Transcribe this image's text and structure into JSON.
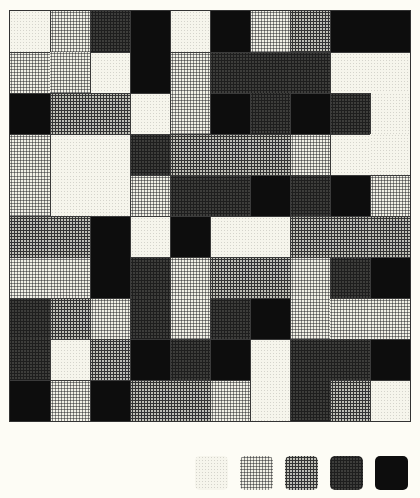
{
  "figure": {
    "rows": 10,
    "cols": 10,
    "levels": [
      1,
      2,
      3,
      4,
      5
    ],
    "grid": [
      [
        1,
        2,
        4,
        5,
        1,
        5,
        2,
        3,
        5,
        5
      ],
      [
        2,
        2,
        1,
        5,
        2,
        4,
        4,
        4,
        1,
        1
      ],
      [
        5,
        3,
        3,
        1,
        2,
        5,
        4,
        5,
        4,
        1
      ],
      [
        2,
        1,
        1,
        4,
        3,
        3,
        3,
        2,
        1,
        1
      ],
      [
        2,
        1,
        1,
        2,
        4,
        4,
        5,
        4,
        5,
        2
      ],
      [
        3,
        3,
        5,
        1,
        5,
        1,
        1,
        3,
        3,
        3
      ],
      [
        2,
        2,
        5,
        4,
        2,
        3,
        3,
        2,
        4,
        5
      ],
      [
        4,
        3,
        2,
        4,
        2,
        4,
        5,
        2,
        2,
        2
      ],
      [
        4,
        1,
        3,
        5,
        4,
        5,
        1,
        4,
        4,
        5
      ],
      [
        5,
        2,
        5,
        3,
        3,
        2,
        1,
        4,
        3,
        1
      ]
    ]
  },
  "legend": {
    "swatches": [
      {
        "level": 1,
        "name": "lightest"
      },
      {
        "level": 2,
        "name": "light"
      },
      {
        "level": 3,
        "name": "medium"
      },
      {
        "level": 4,
        "name": "dark"
      },
      {
        "level": 5,
        "name": "darkest"
      }
    ]
  }
}
